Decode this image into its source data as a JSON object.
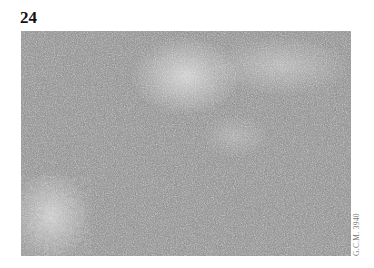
{
  "figure": {
    "number": "24",
    "image_description": "Grayscale histology micrograph of densely packed lymphoid cells",
    "credit": "G.C.M. 3940"
  }
}
